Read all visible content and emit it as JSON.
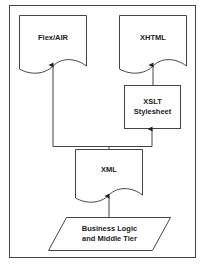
{
  "diagram": {
    "type": "flowchart",
    "nodes": {
      "flex_air": {
        "label": "Flex/AIR",
        "shape": "document"
      },
      "xhtml": {
        "label": "XHTML",
        "shape": "document"
      },
      "xslt": {
        "label_line1": "XSLT",
        "label_line2": "Stylesheet",
        "shape": "rectangle"
      },
      "xml": {
        "label": "XML",
        "shape": "document"
      },
      "business_logic": {
        "label_line1": "Business Logic",
        "label_line2": "and Middle Tier",
        "shape": "parallelogram"
      }
    },
    "edges": [
      {
        "from": "business_logic",
        "to": "xml"
      },
      {
        "from": "xml",
        "to": "flex_air"
      },
      {
        "from": "xml",
        "to": "xslt"
      },
      {
        "from": "xslt",
        "to": "xhtml"
      }
    ],
    "colors": {
      "stroke": "#333333",
      "background": "#ffffff"
    }
  }
}
